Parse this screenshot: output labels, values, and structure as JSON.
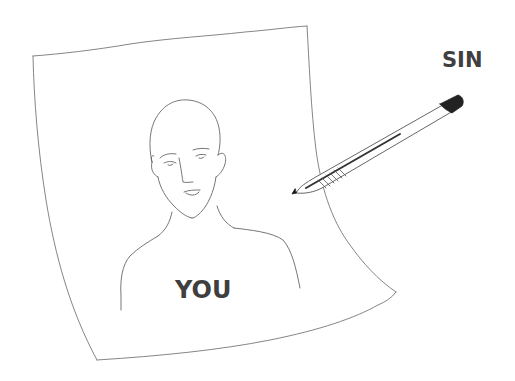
{
  "illustration": {
    "pen_label": "SIN",
    "portrait_label": "YOU"
  },
  "colors": {
    "background": "#ffffff",
    "line": "#6a6a6a",
    "text": "#3f3f3f",
    "pen_ink": "#222222"
  }
}
